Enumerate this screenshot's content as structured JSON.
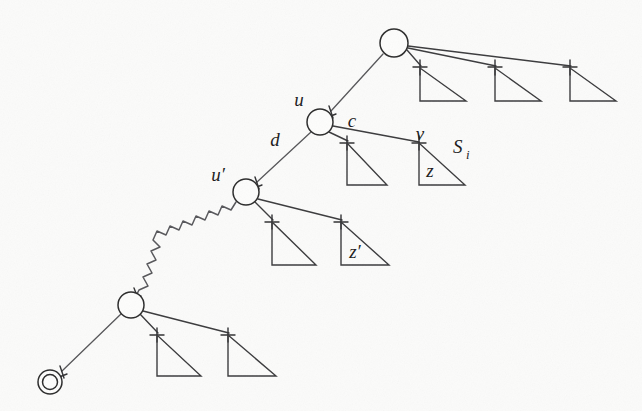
{
  "figure": {
    "kind": "tree-diagram",
    "caption": "",
    "background_color": "#fbfbfa",
    "ink_color": "#3a3a3c",
    "labels": {
      "u": "u",
      "u_prime": "u′",
      "d": "d",
      "c": "c",
      "v": "v",
      "z": "z",
      "z_prime": "z′",
      "S_i": "S",
      "S_i_sub": "i"
    },
    "nodes": [
      {
        "id": "root",
        "name": "root-node",
        "cx": 394,
        "cy": 43,
        "r": 14,
        "double": false,
        "label": ""
      },
      {
        "id": "u",
        "name": "node-u",
        "cx": 320,
        "cy": 122,
        "r": 13,
        "double": false,
        "label": "u"
      },
      {
        "id": "u-prime",
        "name": "node-u-prime",
        "cx": 246,
        "cy": 192,
        "r": 13,
        "double": false,
        "label": "u′"
      },
      {
        "id": "lower",
        "name": "node-lower",
        "cx": 131,
        "cy": 305,
        "r": 13,
        "double": false,
        "label": ""
      },
      {
        "id": "terminal",
        "name": "node-terminal",
        "cx": 50,
        "cy": 382,
        "r": 12,
        "double": true,
        "label": ""
      }
    ],
    "edges": [
      {
        "name": "edge-root-to-u",
        "from": "root",
        "to": "u",
        "style": "straight",
        "label": ""
      },
      {
        "name": "edge-u-to-u-prime",
        "from": "u",
        "to": "u-prime",
        "style": "straight",
        "label": "d"
      },
      {
        "name": "edge-u-to-v",
        "from": "u",
        "to": "v",
        "style": "straight",
        "label": "c"
      },
      {
        "name": "edge-u-prime-to-lower",
        "from": "u-prime",
        "to": "lower",
        "style": "squiggly",
        "label": ""
      },
      {
        "name": "edge-lower-to-terminal",
        "from": "lower",
        "to": "terminal",
        "style": "straight",
        "label": ""
      }
    ],
    "subtrees": [
      {
        "name": "subtree-root-1",
        "parent": "root",
        "apex_x": 420,
        "apex_y": 68,
        "base_y": 101,
        "width": 46,
        "label": ""
      },
      {
        "name": "subtree-root-2",
        "parent": "root",
        "apex_x": 495,
        "apex_y": 68,
        "base_y": 101,
        "width": 46,
        "label": ""
      },
      {
        "name": "subtree-root-3",
        "parent": "root",
        "apex_x": 570,
        "apex_y": 68,
        "base_y": 101,
        "width": 46,
        "label": ""
      },
      {
        "name": "subtree-u-1",
        "parent": "u",
        "apex_x": 347,
        "apex_y": 143,
        "base_y": 185,
        "width": 40,
        "label": ""
      },
      {
        "name": "subtree-u-v",
        "parent": "u",
        "apex_x": 419,
        "apex_y": 143,
        "base_y": 185,
        "width": 46,
        "label": "z"
      },
      {
        "name": "subtree-uprime-1",
        "parent": "u-prime",
        "apex_x": 272,
        "apex_y": 222,
        "base_y": 265,
        "width": 44,
        "label": ""
      },
      {
        "name": "subtree-uprime-2",
        "parent": "u-prime",
        "apex_x": 341,
        "apex_y": 222,
        "base_y": 265,
        "width": 48,
        "label": "z′"
      },
      {
        "name": "subtree-lower-1",
        "parent": "lower",
        "apex_x": 157,
        "apex_y": 335,
        "base_y": 376,
        "width": 44,
        "label": ""
      },
      {
        "name": "subtree-lower-2",
        "parent": "lower",
        "apex_x": 228,
        "apex_y": 335,
        "base_y": 376,
        "width": 48,
        "label": ""
      }
    ],
    "annotations": [
      {
        "name": "label-u",
        "text": "u",
        "x": 299,
        "y": 106,
        "size": "main"
      },
      {
        "name": "label-u-prime",
        "text": "u′",
        "x": 216,
        "y": 180,
        "size": "main"
      },
      {
        "name": "label-d",
        "text": "d",
        "x": 274,
        "y": 142,
        "size": "main"
      },
      {
        "name": "label-c",
        "text": "c",
        "x": 350,
        "y": 125,
        "size": "main"
      },
      {
        "name": "label-v",
        "text": "v",
        "x": 417,
        "y": 141,
        "size": "main"
      },
      {
        "name": "label-z",
        "text": "z",
        "x": 425,
        "y": 175,
        "size": "main"
      },
      {
        "name": "label-z-prime",
        "text": "z′",
        "x": 350,
        "y": 256,
        "size": "main"
      },
      {
        "name": "label-S",
        "text": "S",
        "x": 455,
        "y": 152,
        "size": "main"
      },
      {
        "name": "label-S-sub",
        "text": "i",
        "x": 470,
        "y": 158,
        "size": "sub"
      }
    ]
  }
}
